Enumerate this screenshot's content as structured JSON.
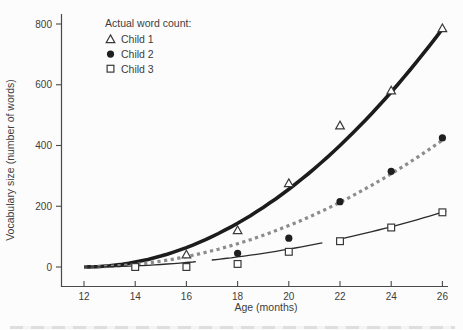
{
  "chart_data": {
    "type": "scatter",
    "title": "",
    "legend_title": "Actual word count:",
    "xlabel": "Age (months)",
    "ylabel": "Vocabulary size (number of words)",
    "x_ticks": [
      12,
      14,
      16,
      18,
      20,
      22,
      24,
      26
    ],
    "y_ticks": [
      0,
      200,
      400,
      600,
      800
    ],
    "xlim": [
      11.1,
      26.3
    ],
    "ylim": [
      -65,
      830
    ],
    "grid": false,
    "legend_position": "top-left-inside",
    "series": [
      {
        "name": "Child 1",
        "marker": "open-triangle",
        "line_style": "solid-thick",
        "color": "#1c1c1c",
        "points": [
          [
            16,
            40
          ],
          [
            18,
            120
          ],
          [
            20,
            275
          ],
          [
            22,
            465
          ],
          [
            24,
            580
          ],
          [
            26,
            785
          ]
        ],
        "fit": "quadratic",
        "fit_coeff": 4.0,
        "fit_origin_age": 12,
        "fit_age_end": 26.05
      },
      {
        "name": "Child 2",
        "marker": "filled-circle",
        "line_style": "dashed",
        "color": "#8c8c8c",
        "points": [
          [
            18,
            45
          ],
          [
            20,
            95
          ],
          [
            22,
            215
          ],
          [
            24,
            315
          ],
          [
            26,
            425
          ]
        ],
        "fit": "quadratic",
        "fit_coeff": 2.13,
        "fit_origin_age": 12,
        "fit_age_end": 26.05
      },
      {
        "name": "Child 3",
        "marker": "open-square",
        "line_style": "long-dash-thin",
        "color": "#2b2b2b",
        "points": [
          [
            14,
            0
          ],
          [
            16,
            0
          ],
          [
            18,
            10
          ],
          [
            20,
            50
          ],
          [
            22,
            85
          ],
          [
            24,
            130
          ],
          [
            26,
            180
          ]
        ],
        "fit": "quadratic",
        "fit_coeff": 0.92,
        "fit_origin_age": 12,
        "fit_age_end": 26.3
      }
    ],
    "colors": {
      "text": "#3d3d3d",
      "axis": "#4a4a4a",
      "marker_stroke": "#3a3a3a",
      "background": "#fcfcfc"
    }
  }
}
